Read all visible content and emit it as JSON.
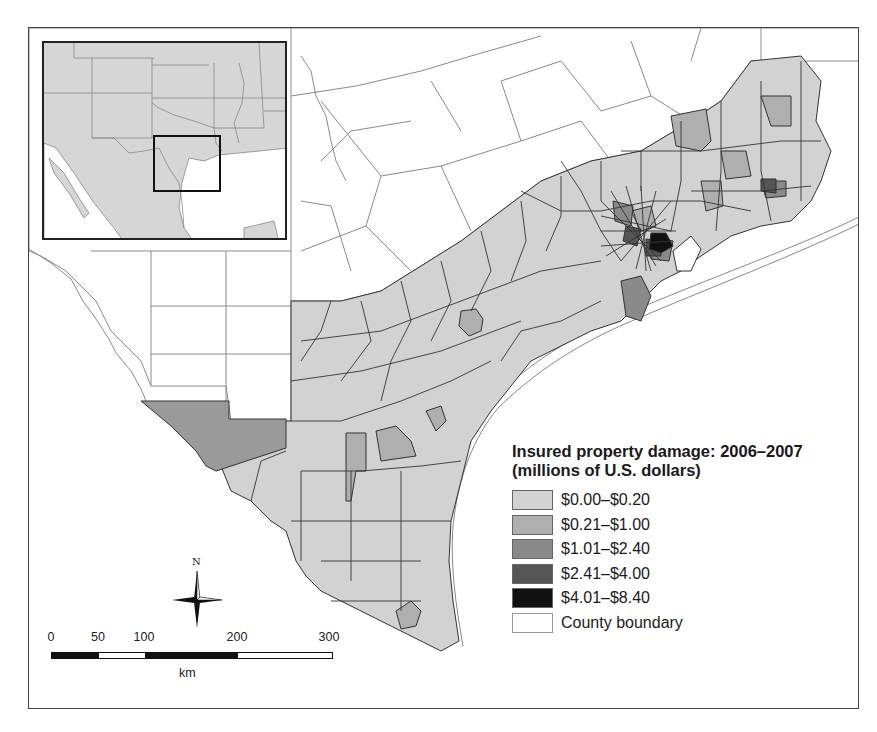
{
  "legend": {
    "title_line1": "Insured property damage: 2006–2007",
    "title_line2": "(millions of U.S. dollars)",
    "items": [
      {
        "label": "$0.00–$0.20",
        "color": "#d2d2d2"
      },
      {
        "label": "$0.21–$1.00",
        "color": "#afafaf"
      },
      {
        "label": "$1.01–$2.40",
        "color": "#8a8a8a"
      },
      {
        "label": "$2.41–$4.00",
        "color": "#555555"
      },
      {
        "label": "$4.01–$8.40",
        "color": "#111111"
      },
      {
        "label": "County boundary",
        "color": "#ffffff"
      }
    ]
  },
  "scale_bar": {
    "ticks": [
      "0",
      "50",
      "100",
      "200",
      "300"
    ],
    "unit": "km"
  },
  "north_arrow": {
    "label": "N"
  },
  "colors": {
    "county_outline": "#888888",
    "zip_outline": "#333333",
    "class0": "#d2d2d2",
    "class1": "#afafaf",
    "class2": "#8a8a8a",
    "class3": "#555555",
    "class4": "#111111",
    "inset_land": "#d6d6d6"
  }
}
